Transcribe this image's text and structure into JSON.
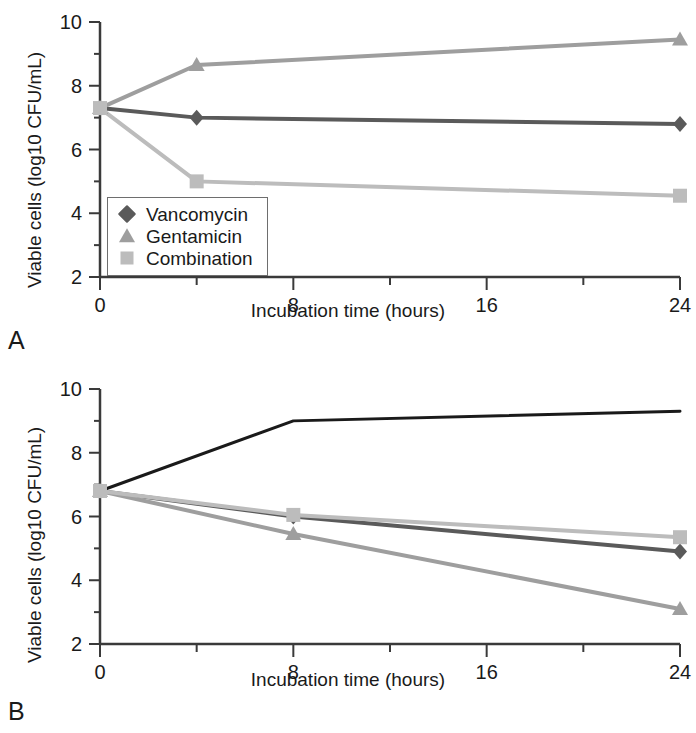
{
  "figure": {
    "panels": [
      {
        "letter": "A",
        "xlabel": "Incubation time (hours)",
        "ylabel": "Viable cells (log10 CFU/mL)",
        "xticks": [
          "0",
          "8",
          "16",
          "24"
        ],
        "yticks": [
          "2",
          "4",
          "6",
          "8",
          "10"
        ],
        "legend": [
          {
            "label": "Vancomycin",
            "marker": "diamond",
            "color": "#5a5a5a"
          },
          {
            "label": "Gentamicin",
            "marker": "triangle",
            "color": "#9e9e9e"
          },
          {
            "label": "Combination",
            "marker": "square",
            "color": "#bcbcbc"
          }
        ]
      },
      {
        "letter": "B",
        "xlabel": "Incubation time (hours)",
        "ylabel": "Viable cells (log10 CFU/mL)",
        "xticks": [
          "0",
          "8",
          "16",
          "24"
        ],
        "yticks": [
          "2",
          "4",
          "6",
          "8",
          "10"
        ],
        "legend": [
          {
            "label": "Drug A",
            "marker": "diamond",
            "color": "#5a5a5a"
          },
          {
            "label": "Drug B",
            "marker": "triangle",
            "color": "#9e9e9e"
          },
          {
            "label": "Combination",
            "marker": "square",
            "color": "#bcbcbc"
          },
          {
            "label": "Without antibiotics",
            "marker": "line",
            "color": "#1a1a1a"
          }
        ]
      }
    ]
  },
  "chart_data": [
    {
      "type": "line",
      "panel": "A",
      "title": "",
      "xlabel": "Incubation time (hours)",
      "ylabel": "Viable cells (log10 CFU/mL)",
      "x": [
        0,
        4,
        24
      ],
      "xlim": [
        0,
        24
      ],
      "ylim": [
        2,
        10
      ],
      "xticks": [
        0,
        8,
        16,
        24
      ],
      "yticks": [
        2,
        4,
        6,
        8,
        10
      ],
      "xminortick_interval": 4,
      "yminortick_interval": 1,
      "grid": false,
      "legend_position": "lower-left-inside",
      "series": [
        {
          "name": "Vancomycin",
          "marker": "diamond",
          "color": "#5a5a5a",
          "values": [
            7.3,
            7.0,
            6.8
          ]
        },
        {
          "name": "Gentamicin",
          "marker": "triangle",
          "color": "#9e9e9e",
          "values": [
            7.3,
            8.65,
            9.45
          ]
        },
        {
          "name": "Combination",
          "marker": "square",
          "color": "#bcbcbc",
          "values": [
            7.3,
            5.0,
            4.55
          ]
        }
      ]
    },
    {
      "type": "line",
      "panel": "B",
      "title": "",
      "xlabel": "Incubation time (hours)",
      "ylabel": "Viable cells (log10 CFU/mL)",
      "x": [
        0,
        8,
        24
      ],
      "xlim": [
        0,
        24
      ],
      "ylim": [
        2,
        10
      ],
      "xticks": [
        0,
        8,
        16,
        24
      ],
      "yticks": [
        2,
        4,
        6,
        8,
        10
      ],
      "xminortick_interval": 4,
      "yminortick_interval": 1,
      "grid": false,
      "legend_position": "lower-left-inside",
      "series": [
        {
          "name": "Drug A",
          "marker": "diamond",
          "color": "#5a5a5a",
          "values": [
            6.8,
            6.0,
            4.9
          ]
        },
        {
          "name": "Drug B",
          "marker": "triangle",
          "color": "#9e9e9e",
          "values": [
            6.8,
            5.45,
            3.1
          ]
        },
        {
          "name": "Combination",
          "marker": "square",
          "color": "#bcbcbc",
          "values": [
            6.8,
            6.05,
            5.35
          ]
        },
        {
          "name": "Without antibiotics",
          "marker": "none",
          "color": "#1a1a1a",
          "values": [
            6.8,
            9.0,
            9.3
          ]
        }
      ]
    }
  ]
}
